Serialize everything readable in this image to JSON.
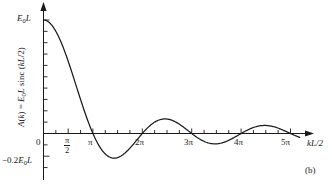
{
  "figure": {
    "panel_label": "(b)",
    "axes": {
      "y_axis_title_parts": {
        "fn": "A(k)",
        "eq": " = ",
        "amp": "E",
        "amp_sub": "0",
        "amp_tail": "L sinc (",
        "arg": "kL",
        "arg_tail": "/2)"
      },
      "y_axis_title": "A(k) = E0L sinc (kL/2)",
      "x_axis_title": "kL/2",
      "x_axis_title_parts": {
        "k": "k",
        "rest": "L/2"
      },
      "origin_label": "0",
      "y_tick_labels": [
        {
          "id": "peak",
          "text": "E0L",
          "sym": "E",
          "sub": "0",
          "tail": "L",
          "value": 1.0
        },
        {
          "id": "neg",
          "text": "-0.2E0L",
          "prefix": "−0.2",
          "sym": "E",
          "sub": "0",
          "tail": "L",
          "value": -0.2
        }
      ],
      "x_tick_labels": [
        {
          "id": "halfpi",
          "num": "π",
          "den": "2",
          "value": 1.5707963
        },
        {
          "id": "pi",
          "text": "π",
          "value": 3.1415927
        },
        {
          "id": "2pi",
          "text": "2π",
          "value": 6.2831853
        },
        {
          "id": "3pi",
          "text": "3π",
          "value": 9.424778
        },
        {
          "id": "4pi",
          "text": "4π",
          "value": 12.5663706
        },
        {
          "id": "5pi",
          "text": "5π",
          "value": 15.7079633
        }
      ]
    }
  },
  "chart_data": {
    "type": "line",
    "title": "",
    "xlabel": "kL/2",
    "ylabel": "A(k) = E0L sinc (kL/2)",
    "xlim": [
      0,
      16.4
    ],
    "ylim": [
      -0.26,
      1.05
    ],
    "grid": false,
    "legend": null,
    "x_tick_values": [
      1.5707963,
      3.1415927,
      6.2831853,
      9.424778,
      12.5663706,
      15.7079633
    ],
    "x_tick_labels": [
      "π/2",
      "π",
      "2π",
      "3π",
      "4π",
      "5π"
    ],
    "x_minor_tick_step": 0.7853982,
    "y_tick_values": [
      1.0,
      -0.2
    ],
    "y_tick_labels": [
      "E0L",
      "-0.2E0L"
    ],
    "y_minor_tick_step": 0.1,
    "function": "y = sinc(x) = sin(x)/x, amplitude E0L",
    "series": [
      {
        "name": "A(k) = E0L sinc(kL/2)",
        "color": "#1a1a1a",
        "x": [
          0,
          0.3927,
          0.7854,
          1.1781,
          1.5708,
          1.9635,
          2.3562,
          2.7489,
          3.1416,
          3.5343,
          3.927,
          4.3197,
          4.4934,
          4.7124,
          5.1051,
          5.4978,
          5.8905,
          6.2832,
          6.6759,
          7.0686,
          7.4613,
          7.7253,
          7.854,
          8.2467,
          8.6394,
          9.0321,
          9.4248,
          9.8175,
          10.2102,
          10.6029,
          10.9956,
          11.0855,
          11.3883,
          11.781,
          12.1737,
          12.5664,
          12.9591,
          13.3518,
          13.7445,
          14.1372,
          14.2074,
          14.5299,
          14.9226,
          15.3153,
          15.708,
          16.1007,
          16.4
        ],
        "y": [
          1.0,
          0.9745,
          0.9003,
          0.7843,
          0.6366,
          0.4705,
          0.3001,
          0.1395,
          0.0,
          -0.1096,
          -0.1871,
          -0.2319,
          -0.2172,
          -0.2122,
          -0.1866,
          -0.1378,
          -0.0759,
          -0.0,
          0.0613,
          0.1033,
          0.1244,
          0.1284,
          0.1273,
          0.1169,
          0.0884,
          0.0477,
          0.0,
          -0.0454,
          -0.0802,
          -0.0993,
          -0.1003,
          -0.0913,
          -0.0838,
          -0.0527,
          -0.0126,
          0.0,
          0.0419,
          0.0691,
          0.0776,
          0.0675,
          0.0708,
          0.0521,
          0.0244,
          -0.0072,
          0.0,
          -0.0242,
          -0.0405
        ]
      }
    ],
    "zeros": [
      3.1416,
      6.2832,
      9.4248,
      12.5664,
      15.708
    ],
    "minima": [
      {
        "x": 4.4934,
        "y": -0.2172
      },
      {
        "x": 10.9041,
        "y": -0.1284
      }
    ],
    "maxima": [
      {
        "x": 0.0,
        "y": 1.0
      },
      {
        "x": 7.7253,
        "y": 0.1284
      },
      {
        "x": 14.0662,
        "y": 0.0913
      }
    ]
  }
}
